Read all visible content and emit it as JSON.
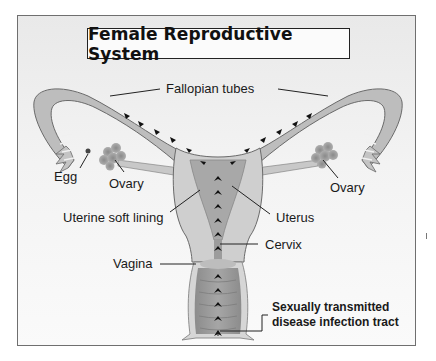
{
  "title": "Female Reproductive System",
  "labels": {
    "fallopian_tubes": "Fallopian tubes",
    "egg": "Egg",
    "ovary_left": "Ovary",
    "ovary_right": "Ovary",
    "uterine_soft_lining": "Uterine soft lining",
    "uterus": "Uterus",
    "cervix": "Cervix",
    "vagina": "Vagina",
    "std_tract_line1": "Sexually transmitted",
    "std_tract_line2": "disease infection tract"
  },
  "colors": {
    "tissue_light": "#c9c9c9",
    "tissue_mid": "#a9a9a9",
    "tissue_dark": "#8a8a8a",
    "outline": "#6a6a6a",
    "arrow": "#111111",
    "text": "#1a1a1a"
  }
}
